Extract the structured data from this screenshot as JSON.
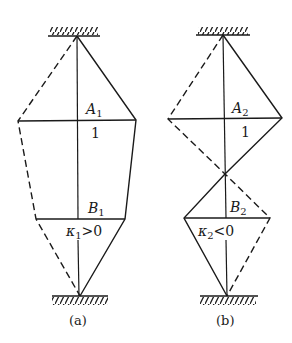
{
  "figure": {
    "panels": [
      {
        "id": "a",
        "caption": "(a)",
        "label_A": "A",
        "sub_A": "1",
        "label_B": "B",
        "sub_B": "1",
        "mid_value": "1",
        "kappa": "κ",
        "kappa_sub": "1",
        "kappa_rel": ">0"
      },
      {
        "id": "b",
        "caption": "(b)",
        "label_A": "A",
        "sub_A": "2",
        "label_B": "B",
        "sub_B": "2",
        "mid_value": "1",
        "kappa": "κ",
        "kappa_sub": "2",
        "kappa_rel": "<0"
      }
    ],
    "colors": {
      "ink": "#1a1a1a",
      "background": "#ffffff"
    }
  }
}
